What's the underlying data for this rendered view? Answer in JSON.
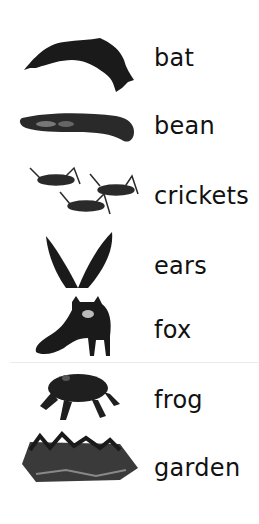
{
  "items": [
    {
      "word": "bat",
      "icon": "bat-icon"
    },
    {
      "word": "bean",
      "icon": "bean-icon"
    },
    {
      "word": "crickets",
      "icon": "crickets-icon"
    },
    {
      "word": "ears",
      "icon": "ears-icon"
    },
    {
      "word": "fox",
      "icon": "fox-icon"
    },
    {
      "word": "frog",
      "icon": "frog-icon"
    },
    {
      "word": "garden",
      "icon": "garden-icon"
    }
  ],
  "colors": {
    "text": "#111111",
    "image": "#1a1a1a",
    "background": "#ffffff"
  }
}
